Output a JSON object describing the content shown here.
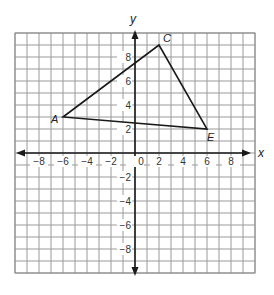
{
  "figure": {
    "type": "coordinate-plane",
    "x_axis_label": "x",
    "y_axis_label": "y",
    "x_range": [
      -10,
      10
    ],
    "y_range": [
      -10,
      10
    ],
    "grid_step": 1,
    "x_tick_labels": [
      {
        "value": -8,
        "text": "−8"
      },
      {
        "value": -6,
        "text": "−6"
      },
      {
        "value": -4,
        "text": "−4"
      },
      {
        "value": -2,
        "text": "−2"
      },
      {
        "value": 0,
        "text": "0"
      },
      {
        "value": 2,
        "text": "2"
      },
      {
        "value": 4,
        "text": "4"
      },
      {
        "value": 6,
        "text": "6"
      },
      {
        "value": 8,
        "text": "8"
      }
    ],
    "y_tick_labels": [
      {
        "value": 8,
        "text": "8"
      },
      {
        "value": 6,
        "text": "6"
      },
      {
        "value": 4,
        "text": "4"
      },
      {
        "value": 2,
        "text": "2"
      },
      {
        "value": -2,
        "text": "−2"
      },
      {
        "value": -4,
        "text": "−4"
      },
      {
        "value": -6,
        "text": "−6"
      },
      {
        "value": -8,
        "text": "−8"
      }
    ],
    "triangle": {
      "vertices": [
        {
          "name": "A",
          "x": -6,
          "y": 3,
          "label_dx": -12,
          "label_dy": 6
        },
        {
          "name": "C",
          "x": 2,
          "y": 9,
          "label_dx": 4,
          "label_dy": -3
        },
        {
          "name": "E",
          "x": 6,
          "y": 2,
          "label_dx": 0,
          "label_dy": 12
        }
      ]
    },
    "colors": {
      "grid": "#9a9a9a",
      "axes": "#1a1a1a",
      "triangle": "#1a1a1a",
      "background": "#ffffff"
    }
  }
}
